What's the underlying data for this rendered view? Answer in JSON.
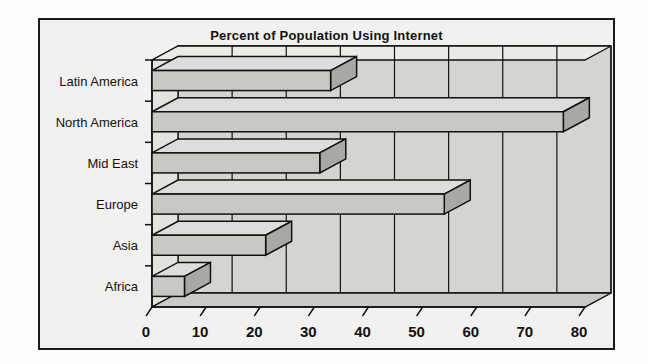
{
  "figure": {
    "title": "Percent of Population Using Internet",
    "background_color": "#f2f1ef",
    "frame_color": "#1a1a1a"
  },
  "chart_data": {
    "type": "bar",
    "orientation": "horizontal",
    "title": "Percent of Population Using Internet",
    "xlabel": "",
    "ylabel": "",
    "categories": [
      "Africa",
      "Asia",
      "Europe",
      "Mid East",
      "North America",
      "Latin America"
    ],
    "values": [
      6,
      21,
      54,
      31,
      76,
      33
    ],
    "xlim": [
      0,
      80
    ],
    "xticks": [
      0,
      10,
      20,
      30,
      40,
      50,
      60,
      70,
      80
    ],
    "xtick_labels": [
      "0",
      "10",
      "20",
      "30",
      "40",
      "50",
      "60",
      "70",
      "80"
    ],
    "grid": true,
    "grid_axis": "x",
    "legend": false,
    "style": "3d-bar",
    "bar_face_color": "#c9c8c5",
    "bar_top_color": "#dedddb",
    "bar_side_color": "#a9a8a5",
    "bar_edge_color": "#111111",
    "plot_wall_color": "#d5d4d1",
    "plot_floor_color": "#cbcac7"
  },
  "axis": {
    "category_labels": [
      "Latin America",
      "North America",
      "Mid East",
      "Europe",
      "Asia",
      "Africa"
    ],
    "tick_labels": [
      "0",
      "10",
      "20",
      "30",
      "40",
      "50",
      "60",
      "70",
      "80"
    ]
  }
}
